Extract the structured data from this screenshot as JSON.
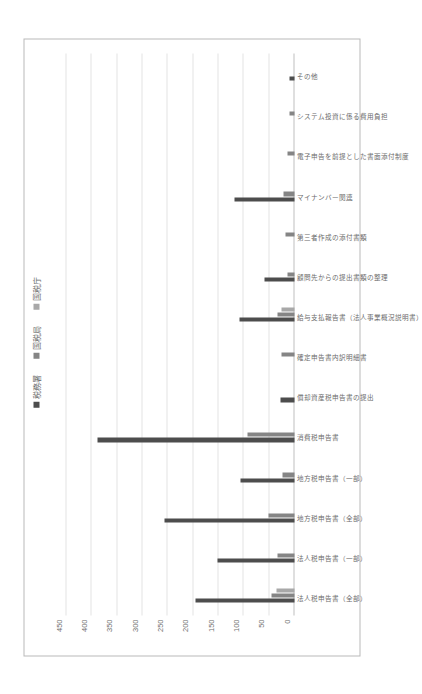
{
  "scan": {
    "header_text": "添付書類の電子化に関するアンケート調査結果"
  },
  "chart_data": {
    "type": "bar",
    "title": "",
    "subtitle": "",
    "xlabel": "",
    "ylabel": "",
    "ylim": [
      0,
      450
    ],
    "yticks": [
      0,
      50,
      100,
      150,
      200,
      250,
      300,
      350,
      400,
      450
    ],
    "ytick_labels": [
      "0",
      "50",
      "100",
      "150",
      "200",
      "250",
      "300",
      "350",
      "400",
      "450"
    ],
    "grid": true,
    "legend_position": "top-center",
    "orientation": "page-rotated-90ccw",
    "legend": [
      {
        "name": "税務署",
        "color": "#4d4d4d"
      },
      {
        "name": "国税局",
        "color": "#858585"
      },
      {
        "name": "国税庁",
        "color": "#a8a8a8"
      }
    ],
    "categories": [
      "法人税申告書（全部）",
      "法人税申告書（一部）",
      "地方税申告書（全部）",
      "地方税申告書（一部）",
      "消費税申告書",
      "償却資産税申告書の提出",
      "確定申告書内訳明細書",
      "給与支払報告書（法人事業概況説明書）",
      "顧問先からの提出書類の整理",
      "第三者作成の添付書類",
      "マイナンバー関連",
      "電子申告を前提とした書面添付制度",
      "システム投資に係る費用負担",
      "その他"
    ],
    "series": [
      {
        "name": "税務署",
        "color": "#4d4d4d",
        "values": [
          196,
          152,
          256,
          107,
          388,
          27,
          0,
          108,
          59,
          0,
          119,
          0,
          0,
          9
        ]
      },
      {
        "name": "国税局",
        "color": "#858585",
        "values": [
          45,
          33,
          52,
          23,
          92,
          0,
          25,
          33,
          13,
          17,
          22,
          13,
          9,
          0
        ]
      },
      {
        "name": "国税庁",
        "color": "#a8a8a8",
        "values": [
          36,
          0,
          0,
          0,
          0,
          0,
          0,
          26,
          0,
          0,
          0,
          0,
          0,
          0
        ]
      }
    ]
  }
}
